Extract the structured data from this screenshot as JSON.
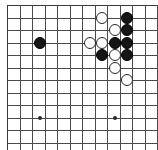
{
  "figure": {
    "kind": "go-board-diagram",
    "title": "",
    "caption": ""
  },
  "board": {
    "size": 13,
    "visible_columns": 12,
    "visible_rows": 12,
    "origin_x": 7,
    "origin_y": 5,
    "spacing": 12.5,
    "line_color": "#4a4a4a",
    "edge_color": "#3a3a3a",
    "background_color": "#ffffff",
    "star_point_radius": 2,
    "stone_radius": 6.3
  },
  "star_points": [
    {
      "name": "hoshi-left",
      "col": 3,
      "row": 9,
      "x": 40,
      "y": 118
    },
    {
      "name": "hoshi-right",
      "col": 9,
      "row": 9,
      "x": 115,
      "y": 118
    }
  ],
  "stones": [
    {
      "name": "black-stone-lone",
      "color": "black",
      "col": 3,
      "row": 3,
      "x": 40,
      "y": 43
    },
    {
      "name": "white-stone-a",
      "color": "white",
      "col": 8,
      "row": 1,
      "x": 102,
      "y": 18
    },
    {
      "name": "black-stone-b",
      "color": "black",
      "col": 10,
      "row": 1,
      "x": 127,
      "y": 18
    },
    {
      "name": "white-stone-c",
      "color": "white",
      "col": 9,
      "row": 2,
      "x": 115,
      "y": 30
    },
    {
      "name": "black-stone-d",
      "color": "black",
      "col": 10,
      "row": 2,
      "x": 127,
      "y": 30
    },
    {
      "name": "white-stone-e",
      "color": "white",
      "col": 7,
      "row": 3,
      "x": 90,
      "y": 43
    },
    {
      "name": "white-stone-f",
      "color": "white",
      "col": 8,
      "row": 3,
      "x": 102,
      "y": 43
    },
    {
      "name": "black-stone-g",
      "color": "black",
      "col": 9,
      "row": 3,
      "x": 115,
      "y": 43
    },
    {
      "name": "black-stone-h",
      "color": "black",
      "col": 10,
      "row": 3,
      "x": 127,
      "y": 43
    },
    {
      "name": "black-stone-i",
      "color": "black",
      "col": 8,
      "row": 4,
      "x": 102,
      "y": 55
    },
    {
      "name": "white-stone-j",
      "color": "white",
      "col": 9,
      "row": 4,
      "x": 115,
      "y": 55
    },
    {
      "name": "black-stone-k",
      "color": "black",
      "col": 10,
      "row": 4,
      "x": 127,
      "y": 55
    },
    {
      "name": "white-stone-l",
      "color": "white",
      "col": 9,
      "row": 5,
      "x": 115,
      "y": 68
    },
    {
      "name": "white-stone-m",
      "color": "white",
      "col": 10,
      "row": 6,
      "x": 127,
      "y": 80
    }
  ],
  "counts": {
    "black_stones": 7,
    "white_stones": 7,
    "total_stones": 14
  }
}
